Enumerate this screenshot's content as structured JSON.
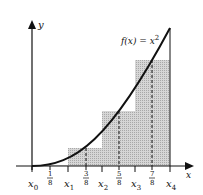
{
  "diagram": {
    "type": "riemann-midpoint-sum",
    "function_label": "f(x) = x²",
    "function_label_parts": {
      "prefix": "f(x) = x",
      "exponent": "2"
    },
    "axes": {
      "x_label": "x",
      "y_label": "y"
    },
    "partition_labels": [
      {
        "base": "x",
        "sub": "0"
      },
      {
        "base": "x",
        "sub": "1"
      },
      {
        "base": "x",
        "sub": "2"
      },
      {
        "base": "x",
        "sub": "3"
      },
      {
        "base": "x",
        "sub": "4"
      }
    ],
    "midpoints": [
      {
        "num": "1",
        "den": "8"
      },
      {
        "num": "3",
        "den": "8"
      },
      {
        "num": "5",
        "den": "8"
      },
      {
        "num": "7",
        "den": "8"
      }
    ],
    "colors": {
      "bar_fill": "#cfcfcf",
      "curve": "#111111",
      "axis": "#111111"
    }
  }
}
